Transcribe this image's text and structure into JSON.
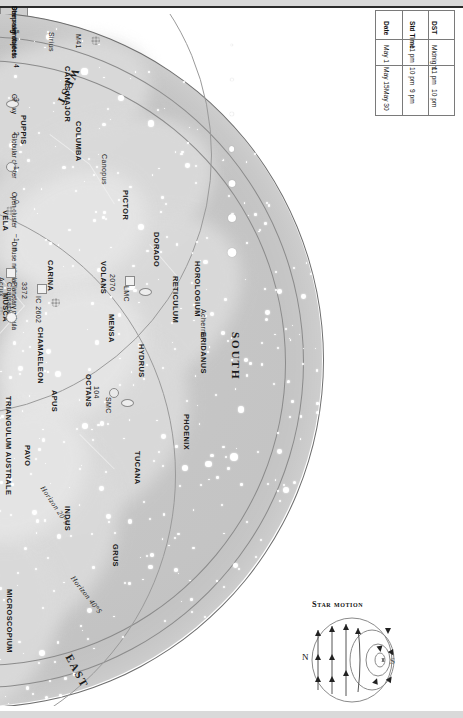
{
  "chart": {
    "type": "star-chart",
    "orientation_note": "chart rotated 90 degrees",
    "directions": {
      "west": "WEST",
      "east": "EAST",
      "south": "SOUTH"
    },
    "horizon_lines": [
      "Horizon 20°S",
      "Horizon 40°S"
    ],
    "ecliptic_labels": [
      "Ecliptic",
      "Ecliptic"
    ],
    "declination_marks": [
      "20°S",
      "40°S"
    ],
    "constellations": [
      {
        "name": "CANIS MAJOR",
        "x": 222,
        "y": 52
      },
      {
        "name": "PUPPIS",
        "x": 178,
        "y": 101
      },
      {
        "name": "PYXIS",
        "x": 130,
        "y": 128
      },
      {
        "name": "ANTLIA",
        "x": 92,
        "y": 146
      },
      {
        "name": "VELA",
        "x": 160,
        "y": 196
      },
      {
        "name": "COLUMBA",
        "x": 233,
        "y": 107
      },
      {
        "name": "PICTOR",
        "x": 280,
        "y": 176
      },
      {
        "name": "CORVUS",
        "x": 44,
        "y": 205
      },
      {
        "name": "CRATER",
        "x": 62,
        "y": 196
      },
      {
        "name": "HYDRA",
        "x": 83,
        "y": 222
      },
      {
        "name": "CRUX",
        "x": 135,
        "y": 262
      },
      {
        "name": "CENTAURUS",
        "x": 84,
        "y": 290
      },
      {
        "name": "MUSCA",
        "x": 160,
        "y": 279
      },
      {
        "name": "CARINA",
        "x": 205,
        "y": 246
      },
      {
        "name": "CHAMAELEON",
        "x": 195,
        "y": 313
      },
      {
        "name": "VOLANS",
        "x": 258,
        "y": 247
      },
      {
        "name": "MENSA",
        "x": 266,
        "y": 300
      },
      {
        "name": "DORADO",
        "x": 311,
        "y": 218
      },
      {
        "name": "RETICULUM",
        "x": 330,
        "y": 262
      },
      {
        "name": "HOROLOGIUM",
        "x": 352,
        "y": 247
      },
      {
        "name": "ERIDANUS",
        "x": 358,
        "y": 318
      },
      {
        "name": "HYDRUS",
        "x": 296,
        "y": 330
      },
      {
        "name": "OCTANS",
        "x": 243,
        "y": 360
      },
      {
        "name": "APUS",
        "x": 209,
        "y": 376
      },
      {
        "name": "TRIANGULUM AUSTRALE",
        "x": 163,
        "y": 382
      },
      {
        "name": "CIRCINUS",
        "x": 137,
        "y": 370
      },
      {
        "name": "NORMA",
        "x": 113,
        "y": 400
      },
      {
        "name": "LUPUS",
        "x": 92,
        "y": 375
      },
      {
        "name": "LIBRA",
        "x": 28,
        "y": 400
      },
      {
        "name": "SCORPIUS",
        "x": 57,
        "y": 458
      },
      {
        "name": "ARA",
        "x": 121,
        "y": 440
      },
      {
        "name": "TELESCOPIUM",
        "x": 148,
        "y": 466
      },
      {
        "name": "CORONA AUSTRALIS",
        "x": 110,
        "y": 508
      },
      {
        "name": "SAGITTARIUS",
        "x": 78,
        "y": 543
      },
      {
        "name": "SCUTUM",
        "x": 22,
        "y": 560
      },
      {
        "name": "PAVO",
        "x": 182,
        "y": 431
      },
      {
        "name": "INDUS",
        "x": 222,
        "y": 492
      },
      {
        "name": "MICROSCOPIUM",
        "x": 164,
        "y": 575
      },
      {
        "name": "GRUS",
        "x": 270,
        "y": 530
      },
      {
        "name": "TUCANA",
        "x": 292,
        "y": 437
      },
      {
        "name": "PHOENIX",
        "x": 341,
        "y": 400
      }
    ],
    "stars_named": [
      {
        "name": "Sirius",
        "x": 205,
        "y": 18
      },
      {
        "name": "Canopus",
        "x": 258,
        "y": 140
      },
      {
        "name": "Acrux",
        "x": 155,
        "y": 263
      },
      {
        "name": "Alpha Centauri",
        "x": 118,
        "y": 317
      },
      {
        "name": "Beta Centauri",
        "x": 128,
        "y": 300
      },
      {
        "name": "Antares",
        "x": 56,
        "y": 430
      },
      {
        "name": "Achernar",
        "x": 357,
        "y": 295
      }
    ],
    "deep_sky_objects": [
      {
        "label": "M41",
        "x": 232,
        "y": 20,
        "type": "open"
      },
      {
        "label": "M6",
        "x": 86,
        "y": 465,
        "type": "open"
      },
      {
        "label": "M7",
        "x": 92,
        "y": 492,
        "type": "open"
      },
      {
        "label": "M8",
        "x": 75,
        "y": 518,
        "type": "diffuse"
      },
      {
        "label": "M22",
        "x": 66,
        "y": 545,
        "type": "globular"
      },
      {
        "label": "5139",
        "x": 113,
        "y": 295,
        "type": "globular"
      },
      {
        "label": "4755",
        "x": 135,
        "y": 290,
        "type": "open"
      },
      {
        "label": "3372",
        "x": 178,
        "y": 268,
        "type": "diffuse"
      },
      {
        "label": "IC 2602",
        "x": 192,
        "y": 282,
        "type": "open"
      },
      {
        "label": "Coalsack",
        "x": 163,
        "y": 268,
        "type": "dark"
      },
      {
        "label": "2070",
        "x": 266,
        "y": 260,
        "type": "diffuse"
      },
      {
        "label": "LMC",
        "x": 280,
        "y": 272,
        "type": "galaxy"
      },
      {
        "label": "104",
        "x": 250,
        "y": 372,
        "type": "globular"
      },
      {
        "label": "SMC",
        "x": 262,
        "y": 383,
        "type": "galaxy"
      }
    ]
  },
  "time_table": {
    "headers": [
      "Date",
      "Std Time",
      "DST"
    ],
    "rows": [
      [
        "May 1",
        "11 pm",
        "Midnight"
      ],
      [
        "May 15",
        "10 pm",
        "11 pm"
      ],
      [
        "May 30",
        "9 pm",
        "10 pm"
      ]
    ]
  },
  "dso_legend": {
    "title": "Deep-sky objects",
    "items": [
      {
        "label": "Galaxy",
        "icon": "galaxy-icon"
      },
      {
        "label": "Globular cluster",
        "icon": "globular-cluster-icon"
      },
      {
        "label": "Open cluster",
        "icon": "open-cluster-icon"
      },
      {
        "label": "Diffuse nebula",
        "icon": "diffuse-nebula-icon"
      },
      {
        "label": "Planetary nebula",
        "icon": "planetary-nebula-icon"
      }
    ]
  },
  "magnitude_legend": {
    "title": "Star magnitudes",
    "values": [
      "−1",
      "0",
      "1",
      "2",
      "3",
      "4",
      "5"
    ],
    "sizes": [
      9,
      8,
      7,
      5.8,
      4.4,
      3.2,
      2.4
    ]
  },
  "star_motion": {
    "title": "Star motion",
    "north_label": "N",
    "south_label": "S"
  }
}
